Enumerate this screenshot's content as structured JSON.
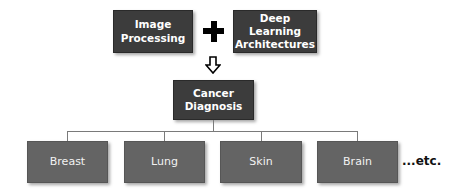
{
  "diagram": {
    "inputs": [
      {
        "label_line1": "Image",
        "label_line2": "Processing"
      },
      {
        "label_line1": "Deep Learning",
        "label_line2": "Architectures"
      }
    ],
    "operator": "+",
    "result": {
      "label_line1": "Cancer",
      "label_line2": "Diagnosis"
    },
    "categories": [
      {
        "label": "Breast"
      },
      {
        "label": "Lung"
      },
      {
        "label": "Skin"
      },
      {
        "label": "Brain"
      }
    ],
    "continuation": "...etc.",
    "colors": {
      "top_box": "#3c3c3c",
      "bottom_box": "#646464",
      "connector": "#7a7a7a",
      "text": "#ffffff"
    }
  }
}
